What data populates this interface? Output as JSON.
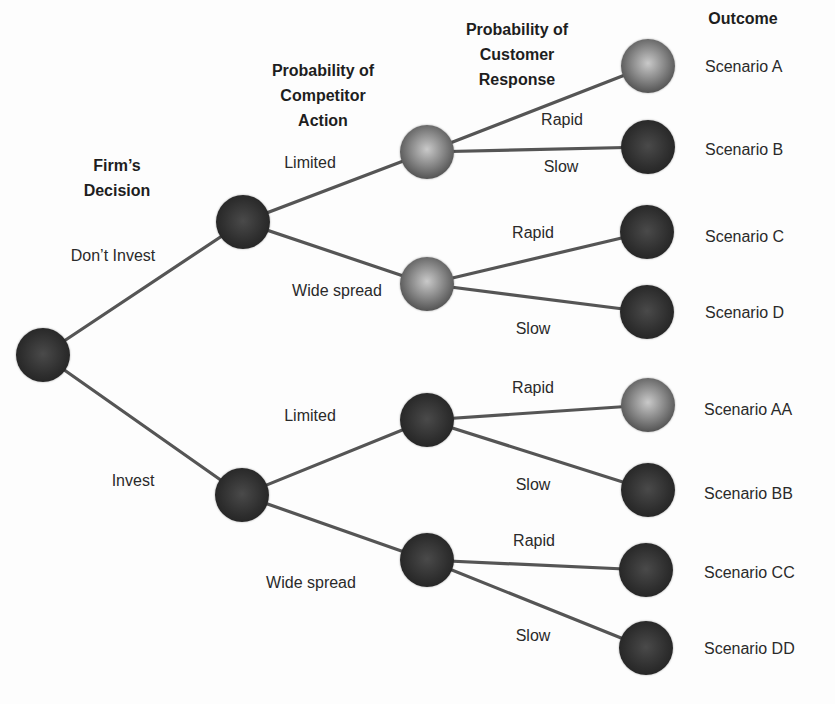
{
  "headers": {
    "firms_decision": [
      "Firm’s",
      "Decision"
    ],
    "competitor_action": [
      "Probability of",
      "Competitor",
      "Action"
    ],
    "customer_response": [
      "Probability of",
      "Customer",
      "Response"
    ],
    "outcome": "Outcome"
  },
  "edge_labels": {
    "dont_invest": "Don’t Invest",
    "invest": "Invest",
    "top_limited": "Limited",
    "top_wide_spread": "Wide spread",
    "bottom_limited": "Limited",
    "bottom_wide_spread": "Wide spread",
    "a_rapid": "Rapid",
    "b_slow": "Slow",
    "c_rapid": "Rapid",
    "d_slow": "Slow",
    "aa_rapid": "Rapid",
    "bb_slow": "Slow",
    "cc_rapid": "Rapid",
    "dd_slow": "Slow"
  },
  "outcomes": [
    "Scenario A",
    "Scenario B",
    "Scenario C",
    "Scenario D",
    "Scenario AA",
    "Scenario BB",
    "Scenario CC",
    "Scenario DD"
  ],
  "colors": {
    "edge": "#555555",
    "node_dark": "#2e2e2e",
    "node_light": "#9a9a9a"
  }
}
